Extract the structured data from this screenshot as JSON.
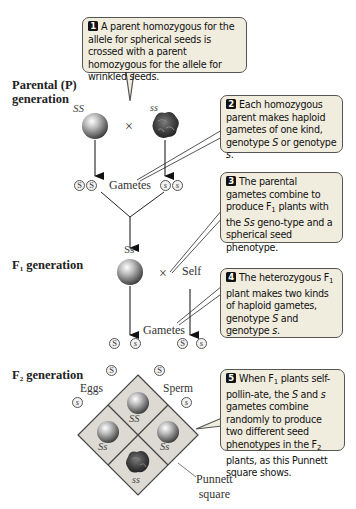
{
  "labels": {
    "parental_generation": "Parental (P) generation",
    "f1_generation_main": "F",
    "f1_generation_sub": "1",
    "f1_generation_rest": " generation",
    "f2_generation_main": "F",
    "f2_generation_sub": "2",
    "f2_generation_rest": " generation"
  },
  "parental": {
    "left_genotype": "SS",
    "right_genotype": "ss",
    "cross_symbol": "×",
    "left_phenotype": "spherical-seed",
    "right_phenotype": "wrinkled-seed"
  },
  "parental_gametes": {
    "label": "Gametes",
    "left": [
      "S",
      "S"
    ],
    "right": [
      "s",
      "s"
    ]
  },
  "f1": {
    "genotype": "Ss",
    "cross_symbol": "×",
    "self_label": "Self"
  },
  "f1_gametes": {
    "label": "Gametes",
    "left": [
      "S",
      "s"
    ],
    "right": [
      "S",
      "s"
    ]
  },
  "punnett": {
    "eggs_label": "Eggs",
    "sperm_label": "Sperm",
    "egg_alleles": [
      "S",
      "s"
    ],
    "sperm_alleles": [
      "S",
      "s"
    ],
    "cells": [
      {
        "position": "top",
        "genotype": "SS",
        "phenotype": "spherical"
      },
      {
        "position": "left",
        "genotype": "Ss",
        "phenotype": "spherical"
      },
      {
        "position": "right",
        "genotype": "Ss",
        "phenotype": "spherical"
      },
      {
        "position": "bottom",
        "genotype": "ss",
        "phenotype": "wrinkled"
      }
    ],
    "caption_line1": "Punnett",
    "caption_line2": "square"
  },
  "callouts": [
    {
      "number": "1",
      "text": "A parent homozygous for the allele for spherical seeds is crossed with a parent homozygous for the allele for wrinkled seeds."
    },
    {
      "number": "2",
      "text_a": "Each homozygous parent makes haploid gametes of one kind, genotype ",
      "italic_a": "S",
      "text_b": " or genotype ",
      "italic_b": "s",
      "text_c": "."
    },
    {
      "number": "3",
      "text_a": "The parental gametes combine to produce F",
      "sub": "1",
      "text_b": " plants with the ",
      "italic": "Ss",
      "text_c": " geno-type and a spherical seed phenotype."
    },
    {
      "number": "4",
      "text_a": "The heterozygous F",
      "sub": "1",
      "text_b": " plant makes two kinds of haploid gametes, genotype ",
      "italic_a": "S",
      "text_c": " and genotype ",
      "italic_b": "s",
      "text_d": "."
    },
    {
      "number": "5",
      "text_a": "When F",
      "sub_a": "1",
      "text_b": " plants self-pollin-ate, the ",
      "italic_a": "S",
      "text_c": " and ",
      "italic_b": "s",
      "text_d": " gametes combine randomly to produce two different seed phenotypes in the F",
      "sub_b": "2",
      "text_e": " plants, as this Punnett square shows."
    }
  ],
  "colors": {
    "callout_bg": "#f0ecde",
    "punnett_bg": "#dcdad3",
    "line": "#333333"
  }
}
